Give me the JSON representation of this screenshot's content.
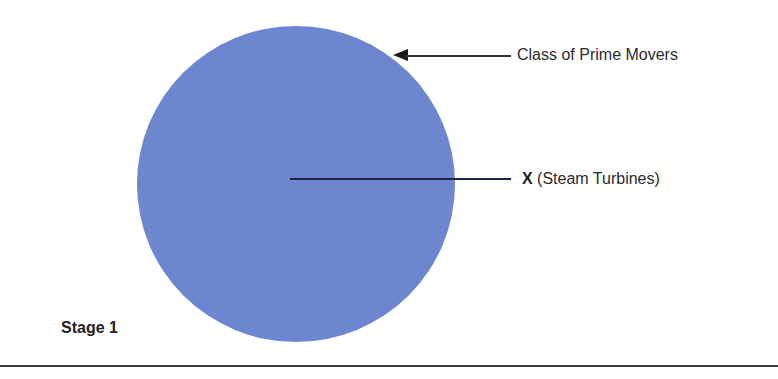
{
  "diagram": {
    "stage_label": "Stage 1",
    "circle": {
      "color": "#6e86cf",
      "represents": "Class of Prime Movers"
    },
    "annotations": [
      {
        "id": "class",
        "text": "Class of  Prime Movers",
        "pointer": "arrow"
      },
      {
        "id": "x",
        "bold_prefix": "X",
        "text": " (Steam Turbines)",
        "pointer": "line"
      }
    ]
  }
}
